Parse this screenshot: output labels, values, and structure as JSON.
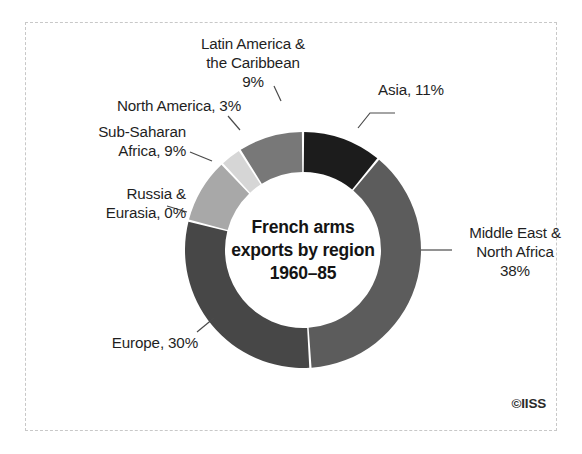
{
  "credit": "©IISS",
  "center": {
    "line1": "French arms",
    "line2": "exports by region",
    "line3": "1960–85"
  },
  "labels": {
    "latin": "Latin America &\nthe Caribbean\n9%",
    "north_america": "North America, 3%",
    "subsaharan": "Sub-Saharan\nAfrica, 9%",
    "russia": "Russia &\nEurasia, 0%",
    "asia": "Asia, 11%",
    "mena": "Middle East &\nNorth Africa\n38%",
    "europe": "Europe, 30%"
  },
  "chart_data": {
    "type": "pie",
    "title": "French arms exports by region 1960–85",
    "subtitle": "",
    "xlabel": "",
    "ylabel": "",
    "units": "percent",
    "donut": true,
    "inner_radius_ratio": 0.66,
    "start_angle_deg": 0,
    "direction": "clockwise",
    "legend": "none",
    "grid": false,
    "categories": [
      "Asia",
      "Middle East & North Africa",
      "Europe",
      "Russia & Eurasia",
      "Sub-Saharan Africa",
      "North America",
      "Latin America & the Caribbean"
    ],
    "values": [
      11,
      38,
      30,
      0,
      9,
      3,
      9
    ],
    "colors": [
      "#1c1c1c",
      "#5c5c5c",
      "#474747",
      "#9a9a9a",
      "#a8a8a8",
      "#d6d6d6",
      "#787878"
    ],
    "annotations": [
      "Asia, 11%",
      "Middle East & North Africa 38%",
      "Europe, 30%",
      "Russia & Eurasia, 0%",
      "Sub-Saharan Africa, 9%",
      "North America, 3%",
      "Latin America & the Caribbean 9%"
    ]
  }
}
